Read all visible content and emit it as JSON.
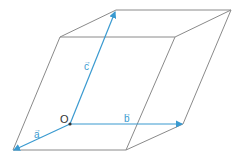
{
  "diagram": {
    "type": "parallelepiped",
    "colors": {
      "edge": "#8a8a8a",
      "vector": "#3a9ad0",
      "origin": "#333333"
    },
    "origin": {
      "label": "O",
      "x": 70,
      "y": 124
    },
    "vectors": [
      {
        "name": "a",
        "label": "a",
        "arrow": "→",
        "from": [
          70,
          124
        ],
        "to": [
          13,
          150
        ]
      },
      {
        "name": "b",
        "label": "b",
        "arrow": "→",
        "from": [
          70,
          124
        ],
        "to": [
          183,
          124
        ]
      },
      {
        "name": "c",
        "label": "c",
        "arrow": "→",
        "from": [
          70,
          124
        ],
        "to": [
          116,
          10
        ]
      }
    ]
  }
}
